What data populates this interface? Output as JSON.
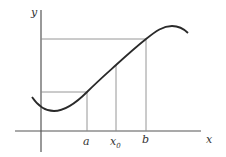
{
  "diagram": {
    "axes": {
      "x_label": "x",
      "y_label": "y"
    },
    "tick_labels": {
      "a": "a",
      "x0_base": "x",
      "x0_sub": "0",
      "b": "b"
    },
    "colors": {
      "curve": "#2a2a2a",
      "axes": "#555555",
      "guides": "#8a8a8a",
      "background": "#ffffff"
    }
  }
}
